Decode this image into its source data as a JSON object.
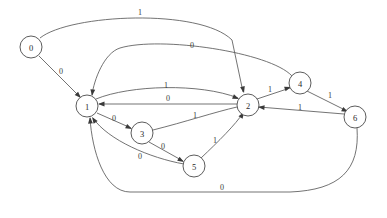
{
  "diagram": {
    "type": "state-machine-graph",
    "title": "",
    "background_color": "#ffffff",
    "node_fill": "#ffffff",
    "node_stroke": "#4a4a4a",
    "edge_stroke": "#5a5a5a",
    "node_radius": 11,
    "nodes": [
      {
        "id": "0",
        "label": "0",
        "x": 31,
        "y": 47
      },
      {
        "id": "1",
        "label": "1",
        "x": 87,
        "y": 106
      },
      {
        "id": "2",
        "label": "2",
        "x": 248,
        "y": 105
      },
      {
        "id": "3",
        "label": "3",
        "x": 142,
        "y": 133
      },
      {
        "id": "4",
        "label": "4",
        "x": 300,
        "y": 83
      },
      {
        "id": "5",
        "label": "5",
        "x": 194,
        "y": 166
      },
      {
        "id": "6",
        "label": "6",
        "x": 355,
        "y": 117
      }
    ],
    "edges": [
      {
        "id": "e0",
        "from": "0",
        "to": "2",
        "label": "1",
        "path": "M 40 38 C 70 14, 200 8, 232 40 L 243 92",
        "label_x": 140,
        "label_y": 12,
        "arrow_x": 244,
        "arrow_y": 93,
        "arrow_angle": 76
      },
      {
        "id": "e1",
        "from": "0",
        "to": "1",
        "label": "0",
        "path": "M 39 56 L 80 97",
        "label_x": 61,
        "label_y": 71,
        "arrow_x": 81,
        "arrow_y": 98,
        "arrow_angle": 45
      },
      {
        "id": "e2",
        "from": "4",
        "to": "1",
        "label": "0",
        "path": "M 292 76 C 270 52, 160 36, 120 48 C 104 53, 94 80, 92 95",
        "label_x": 192,
        "label_y": 45,
        "arrow_x": 92,
        "arrow_y": 96,
        "arrow_angle": 97
      },
      {
        "id": "e3",
        "from": "1",
        "to": "2",
        "label": "1",
        "path": "M 96 99 C 130 85, 200 83, 238 98",
        "label_x": 166,
        "label_y": 85,
        "arrow_x": 239,
        "arrow_y": 99,
        "arrow_angle": 23
      },
      {
        "id": "e4",
        "from": "2",
        "to": "1",
        "label": "0",
        "path": "M 237 104 L 99 104",
        "label_x": 168,
        "label_y": 98,
        "arrow_x": 98,
        "arrow_y": 104,
        "arrow_angle": 180
      },
      {
        "id": "e5",
        "from": "1",
        "to": "3",
        "label": "0",
        "path": "M 97 113 L 131 128",
        "label_x": 114,
        "label_y": 118,
        "arrow_x": 132,
        "arrow_y": 129,
        "arrow_angle": 26
      },
      {
        "id": "e6",
        "from": "3",
        "to": "2",
        "label": "1",
        "path": "M 153 130 C 185 122, 215 112, 237 107",
        "label_x": 195,
        "label_y": 115,
        "arrow_x": 238,
        "arrow_y": 107,
        "arrow_angle": 200
      },
      {
        "id": "e7",
        "from": "3",
        "to": "5",
        "label": "0",
        "path": "M 149 142 L 183 161",
        "label_x": 163,
        "label_y": 146,
        "arrow_x": 184,
        "arrow_y": 162,
        "arrow_angle": 30
      },
      {
        "id": "e8",
        "from": "5",
        "to": "1",
        "label": "0",
        "path": "M 184 164 C 150 158, 108 140, 93 118",
        "label_x": 140,
        "label_y": 156,
        "arrow_x": 92,
        "arrow_y": 117,
        "arrow_angle": 236
      },
      {
        "id": "e9",
        "from": "5",
        "to": "2",
        "label": "1",
        "path": "M 201 158 C 218 142, 236 124, 243 113",
        "label_x": 215,
        "label_y": 140,
        "arrow_x": 244,
        "arrow_y": 112,
        "arrow_angle": 302
      },
      {
        "id": "e10",
        "from": "2",
        "to": "4",
        "label": "1",
        "path": "M 257 99 L 290 88",
        "label_x": 270,
        "label_y": 89,
        "arrow_x": 291,
        "arrow_y": 87,
        "arrow_angle": 342
      },
      {
        "id": "e11",
        "from": "4",
        "to": "6",
        "label": "1",
        "path": "M 307 91 L 347 111",
        "label_x": 330,
        "label_y": 95,
        "arrow_x": 348,
        "arrow_y": 112,
        "arrow_angle": 27
      },
      {
        "id": "e12",
        "from": "6",
        "to": "2",
        "label": "1",
        "path": "M 344 114 L 259 107",
        "label_x": 300,
        "label_y": 107,
        "arrow_x": 258,
        "arrow_y": 107,
        "arrow_angle": 185
      },
      {
        "id": "e13",
        "from": "6",
        "to": "1",
        "label": "0",
        "path": "M 357 128 C 360 170, 340 190, 290 192 L 130 192 C 104 192, 92 150, 90 118",
        "label_x": 222,
        "label_y": 187,
        "arrow_x": 90,
        "arrow_y": 117,
        "arrow_angle": 266
      }
    ]
  }
}
